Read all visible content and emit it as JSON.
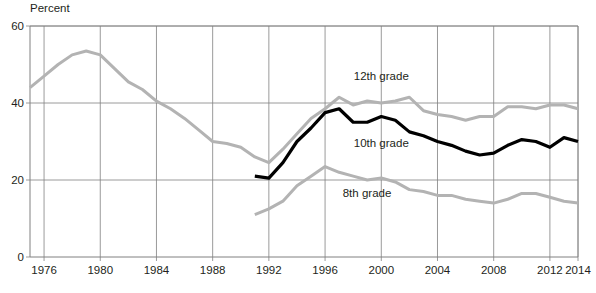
{
  "chart_data": {
    "type": "line",
    "title": "",
    "subtitle": "",
    "xlabel": "",
    "ylabel": "Percent",
    "ylim": [
      0,
      60
    ],
    "xlim": [
      1975,
      2014
    ],
    "yticks": [
      0,
      20,
      40,
      60
    ],
    "xticks": [
      1976,
      1980,
      1984,
      1988,
      1992,
      1996,
      2000,
      2004,
      2008,
      2012,
      2014
    ],
    "grid": true,
    "legend_position": "inline-annotation",
    "series": [
      {
        "name": "12th grade",
        "color": "#b3b3b3",
        "label_x": 2000,
        "label_y": 47,
        "x": [
          1975,
          1976,
          1977,
          1978,
          1979,
          1980,
          1981,
          1982,
          1983,
          1984,
          1985,
          1986,
          1987,
          1988,
          1989,
          1990,
          1991,
          1992,
          1993,
          1994,
          1995,
          1996,
          1997,
          1998,
          1999,
          2000,
          2001,
          2002,
          2003,
          2004,
          2005,
          2006,
          2007,
          2008,
          2009,
          2010,
          2011,
          2012,
          2013,
          2014
        ],
        "values": [
          44.0,
          47.0,
          50.0,
          52.5,
          53.5,
          52.5,
          49.0,
          45.5,
          43.5,
          40.5,
          38.5,
          36.0,
          33.0,
          30.0,
          29.5,
          28.5,
          26.0,
          24.5,
          28.0,
          32.0,
          36.0,
          38.5,
          41.5,
          39.5,
          40.5,
          40.0,
          40.5,
          41.5,
          38.0,
          37.0,
          36.5,
          35.5,
          36.5,
          36.5,
          39.0,
          39.0,
          38.5,
          39.5,
          39.5,
          38.5
        ]
      },
      {
        "name": "10th grade",
        "color": "#000000",
        "label_x": 2000,
        "label_y": 29.5,
        "x": [
          1991,
          1992,
          1993,
          1994,
          1995,
          1996,
          1997,
          1998,
          1999,
          2000,
          2001,
          2002,
          2003,
          2004,
          2005,
          2006,
          2007,
          2008,
          2009,
          2010,
          2011,
          2012,
          2013,
          2014
        ],
        "values": [
          21.0,
          20.5,
          24.5,
          30.0,
          33.5,
          37.5,
          38.5,
          35.0,
          35.0,
          36.5,
          35.5,
          32.5,
          31.5,
          30.0,
          29.0,
          27.5,
          26.5,
          27.0,
          29.0,
          30.5,
          30.0,
          28.5,
          31.0,
          30.0
        ]
      },
      {
        "name": "8th grade",
        "color": "#b3b3b3",
        "label_x": 1999,
        "label_y": 16.5,
        "x": [
          1991,
          1992,
          1993,
          1994,
          1995,
          1996,
          1997,
          1998,
          1999,
          2000,
          2001,
          2002,
          2003,
          2004,
          2005,
          2006,
          2007,
          2008,
          2009,
          2010,
          2011,
          2012,
          2013,
          2014
        ],
        "values": [
          11.0,
          12.5,
          14.5,
          18.5,
          21.0,
          23.5,
          22.0,
          21.0,
          20.0,
          20.5,
          19.5,
          17.5,
          17.0,
          16.0,
          16.0,
          15.0,
          14.5,
          14.0,
          15.0,
          16.5,
          16.5,
          15.5,
          14.5,
          14.0
        ]
      }
    ]
  },
  "axes": {
    "y_title": "Percent",
    "y_tick_labels": [
      "60",
      "40",
      "20",
      "0"
    ],
    "x_tick_labels": [
      "1976",
      "1980",
      "1984",
      "1988",
      "1992",
      "1996",
      "2000",
      "2004",
      "2008",
      "2012",
      "2014"
    ]
  },
  "annotations": {
    "grade12": "12th grade",
    "grade10": "10th grade",
    "grade8": "8th grade"
  },
  "colors": {
    "gray_series": "#b3b3b3",
    "black_series": "#000000",
    "grid": "#808080",
    "text": "#231f20"
  }
}
